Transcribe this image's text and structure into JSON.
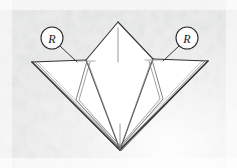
{
  "figure": {
    "kind": "origami-fold-diagram",
    "canvas": {
      "width": 237,
      "height": 168
    },
    "background": {
      "paper_color": "#ffffff",
      "texture_color": "#d8dad8",
      "texture_light": "#eceeec",
      "description": "mottled grey textured paper background"
    },
    "line_color": "#3a3a3a",
    "fold_line_color": "#8a8a8a",
    "fill_color": "#ffffff",
    "model": {
      "name": "folded-paper-model",
      "apex": {
        "x": 118,
        "y": 22
      },
      "bottom_point": {
        "x": 120,
        "y": 150
      },
      "left_wing_tip": {
        "x": 32,
        "y": 62
      },
      "right_wing_tip": {
        "x": 208,
        "y": 61
      },
      "left_shoulder": {
        "x": 86,
        "y": 60
      },
      "right_shoulder": {
        "x": 153,
        "y": 59
      }
    },
    "annotations": [
      {
        "id": "left-repeat-marker",
        "label": "R",
        "meaning": "repeat",
        "circle": {
          "cx": 52,
          "cy": 38,
          "r": 11
        },
        "leader_from": {
          "x": 60,
          "y": 46
        },
        "leader_to": {
          "x": 77,
          "y": 62
        }
      },
      {
        "id": "right-repeat-marker",
        "label": "R",
        "meaning": "repeat",
        "circle": {
          "cx": 187,
          "cy": 38,
          "r": 11
        },
        "leader_from": {
          "x": 179,
          "y": 46
        },
        "leader_to": {
          "x": 163,
          "y": 61
        }
      }
    ]
  }
}
